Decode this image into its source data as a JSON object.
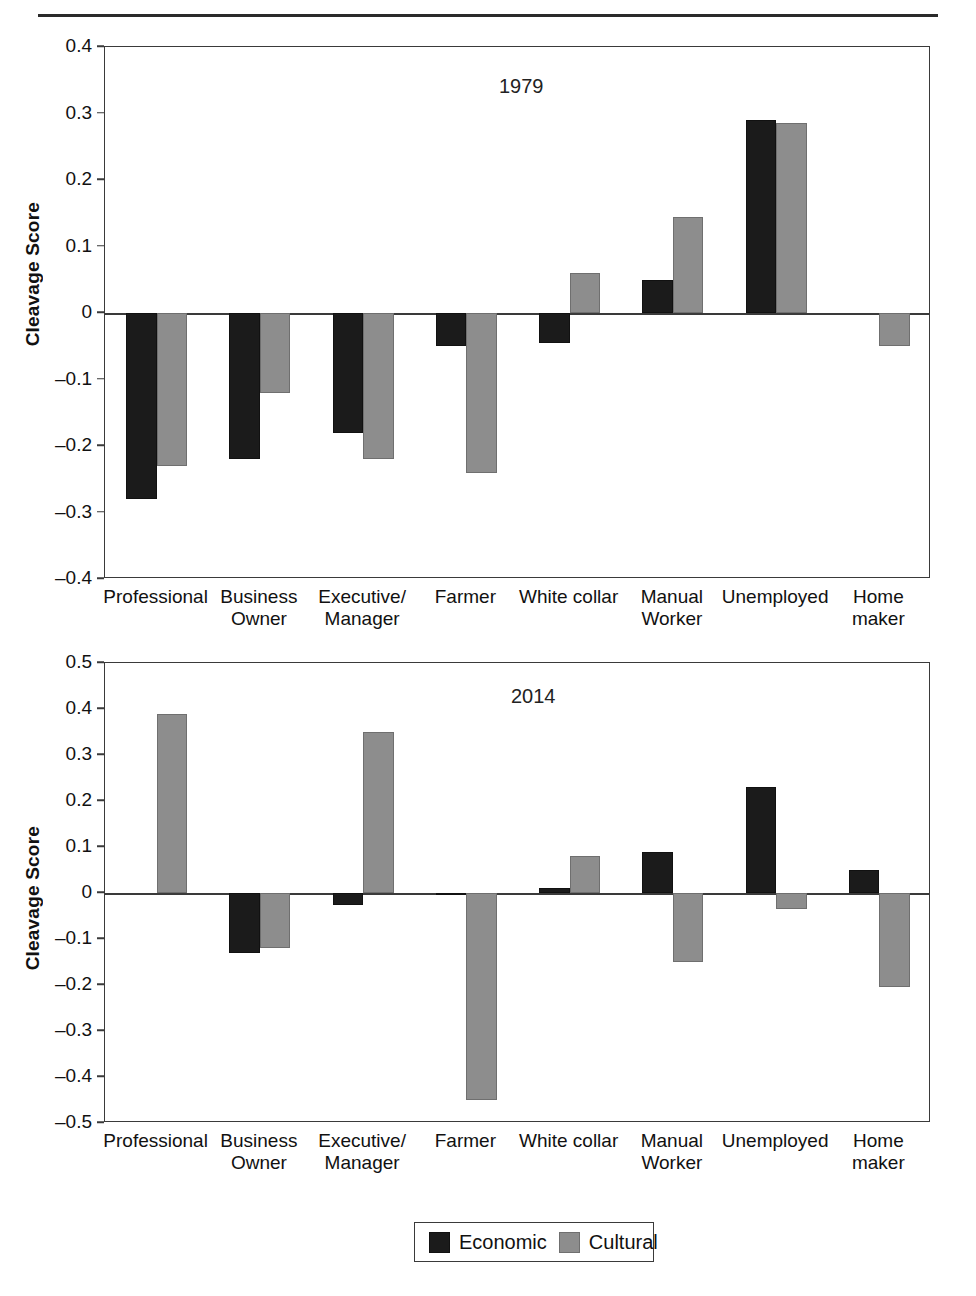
{
  "figure": {
    "ylabel": "Cleavage Score",
    "legend": {
      "economic_label": "Economic",
      "cultural_label": "Cultural",
      "economic_color": "#1b1b1b",
      "cultural_color": "#8d8d8d"
    }
  },
  "chart_data": [
    {
      "type": "bar",
      "title": "1979",
      "xlabel": "",
      "ylabel": "Cleavage Score",
      "ylim": [
        -0.4,
        0.4
      ],
      "yticks": [
        0.4,
        0.3,
        0.2,
        0.1,
        0,
        -0.1,
        -0.2,
        -0.3,
        -0.4
      ],
      "ytick_labels": [
        "0.4",
        "0.3",
        "0.2",
        "0.1",
        "0",
        "–0.1",
        "–0.2",
        "–0.3",
        "–0.4"
      ],
      "grid": false,
      "legend_position": "bottom",
      "categories": [
        "Professional",
        "Business\nOwner",
        "Executive/\nManager",
        "Farmer",
        "White collar",
        "Manual\nWorker",
        "Unemployed",
        "Home\nmaker"
      ],
      "series": [
        {
          "name": "Economic",
          "color": "#1b1b1b",
          "values": [
            -0.28,
            -0.22,
            -0.18,
            -0.05,
            -0.045,
            0.05,
            0.29,
            0
          ]
        },
        {
          "name": "Cultural",
          "color": "#8d8d8d",
          "values": [
            -0.23,
            -0.12,
            -0.22,
            -0.24,
            0.06,
            0.145,
            0.285,
            -0.05
          ]
        }
      ]
    },
    {
      "type": "bar",
      "title": "2014",
      "xlabel": "",
      "ylabel": "Cleavage Score",
      "ylim": [
        -0.5,
        0.5
      ],
      "yticks": [
        0.5,
        0.4,
        0.3,
        0.2,
        0.1,
        0,
        -0.1,
        -0.2,
        -0.3,
        -0.4,
        -0.5
      ],
      "ytick_labels": [
        "0.5",
        "0.4",
        "0.3",
        "0.2",
        "0.1",
        "0",
        "–0.1",
        "–0.2",
        "–0.3",
        "–0.4",
        "–0.5"
      ],
      "grid": false,
      "legend_position": "bottom",
      "categories": [
        "Professional",
        "Business\nOwner",
        "Executive/\nManager",
        "Farmer",
        "White collar",
        "Manual\nWorker",
        "Unemployed",
        "Home\nmaker"
      ],
      "series": [
        {
          "name": "Economic",
          "color": "#1b1b1b",
          "values": [
            0,
            -0.13,
            -0.025,
            -0.005,
            0.01,
            0.09,
            0.23,
            0.05
          ]
        },
        {
          "name": "Cultural",
          "color": "#8d8d8d",
          "values": [
            0.39,
            -0.12,
            0.35,
            -0.45,
            0.08,
            -0.15,
            -0.035,
            -0.205
          ]
        }
      ]
    }
  ]
}
